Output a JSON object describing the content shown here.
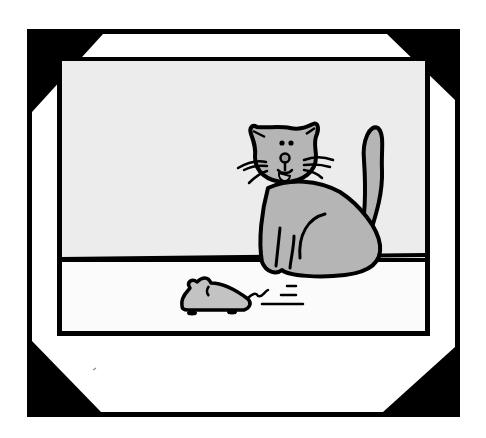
{
  "image": {
    "title": "Cat watching a toy mouse",
    "description": "Cartoon illustration in a photo frame with black corner mounts: a grey cat sits on the floor looking at a wind-up toy mouse with motion lines."
  },
  "frame": {
    "outer_border_color": "#000000",
    "mat_color": "#ffffff",
    "corner_color": "#000000"
  },
  "scene": {
    "wall_color": "#ececec",
    "floor_color": "#fbfbfb",
    "outline_color": "#000000",
    "cat": {
      "body_color": "#b5b5b5",
      "nose_color": "#9a9a9a",
      "tongue_color": "#c8c8c8"
    },
    "mouse": {
      "body_color": "#c3c3c3",
      "wheel_color": "#000000"
    }
  }
}
